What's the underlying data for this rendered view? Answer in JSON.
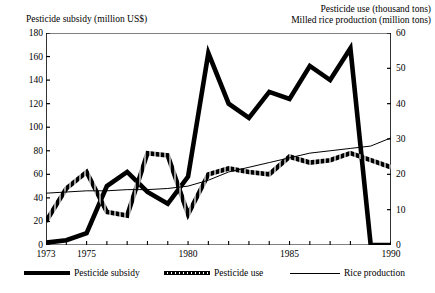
{
  "titles": {
    "left": "Pesticide subsidy (million US$)",
    "right_line1": "Pesticide use (thousand tons)",
    "right_line2": "Milled rice production (million tons)"
  },
  "legend": {
    "subsidy": "Pesticide subsidy",
    "use": "Pesticide use",
    "rice": "Rice production"
  },
  "chart_data": {
    "type": "line",
    "title": "",
    "xlabel": "",
    "ylabel": "Pesticide subsidy (million US$)",
    "y2label": "Pesticide use (thousand tons) / Milled rice production (million tons)",
    "xlim": [
      1973,
      1990
    ],
    "ylim": [
      0,
      180
    ],
    "y2lim": [
      0,
      60
    ],
    "grid": false,
    "legend_position": "below",
    "x": [
      1973,
      1974,
      1975,
      1976,
      1977,
      1978,
      1979,
      1980,
      1981,
      1982,
      1983,
      1984,
      1985,
      1986,
      1987,
      1988,
      1989,
      1990
    ],
    "yticks_left": [
      0,
      20,
      40,
      60,
      80,
      100,
      120,
      140,
      160,
      180
    ],
    "yticks_right": [
      0,
      10,
      20,
      30,
      40,
      50,
      60
    ],
    "xticks_labeled": [
      1973,
      1975,
      1980,
      1985,
      1990
    ],
    "xtick_labels": [
      "1973",
      "1975",
      "1980",
      "1985",
      "1990"
    ],
    "series": [
      {
        "name": "Pesticide subsidy",
        "axis": "left",
        "unit": "million US$",
        "style": "thick-solid",
        "color": "#000000",
        "values": [
          2,
          4,
          10,
          50,
          62,
          45,
          35,
          58,
          163,
          120,
          108,
          130,
          124,
          152,
          140,
          167,
          0,
          0
        ]
      },
      {
        "name": "Pesticide use",
        "axis": "right",
        "unit": "thousand tons",
        "style": "thick-textured",
        "color": "#000000",
        "values_left_scale": [
          20,
          48,
          62,
          28,
          25,
          78,
          76,
          26,
          60,
          65,
          62,
          60,
          75,
          70,
          72,
          78,
          72,
          66
        ],
        "values": [
          6.7,
          16.0,
          20.7,
          9.3,
          8.3,
          26.0,
          25.3,
          8.7,
          20.0,
          21.7,
          20.7,
          20.0,
          25.0,
          23.3,
          24.0,
          26.0,
          24.0,
          22.0
        ]
      },
      {
        "name": "Rice production",
        "axis": "right",
        "unit": "million tons",
        "style": "thin-solid",
        "color": "#000000",
        "values_left_scale": [
          44,
          45,
          46,
          46,
          47,
          47,
          48,
          50,
          55,
          62,
          66,
          70,
          74,
          78,
          80,
          82,
          84,
          91
        ],
        "values": [
          14.7,
          15.0,
          15.3,
          15.3,
          15.7,
          15.7,
          16.0,
          16.7,
          18.3,
          20.7,
          22.0,
          23.3,
          24.7,
          26.0,
          26.7,
          27.3,
          28.0,
          30.3
        ]
      }
    ]
  }
}
